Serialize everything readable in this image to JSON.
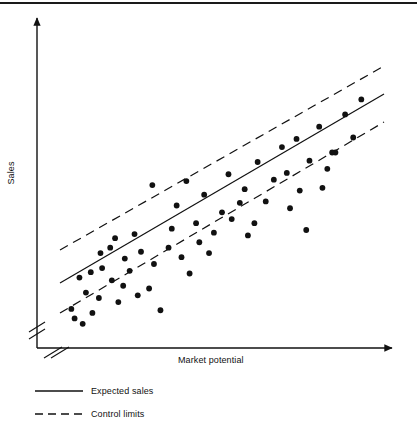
{
  "figure": {
    "kind": "scatter-with-control-limits",
    "background_color": "#ffffff",
    "ink_color": "#111111",
    "top_rule_color": "#1a1a1a"
  },
  "axes": {
    "x_title": "Market potential",
    "y_title": "Sales",
    "x_has_arrow": true,
    "y_has_arrow": true,
    "x_has_break_mark": true,
    "y_has_break_mark": true,
    "x_tick_labels": [],
    "y_tick_labels": [],
    "grid": false
  },
  "legend": {
    "position": "below-plot-left",
    "items": [
      {
        "label": "Expected sales",
        "style": "solid"
      },
      {
        "label": "Control limits",
        "style": "dashed"
      }
    ]
  },
  "chart_data": {
    "type": "scatter",
    "title": "",
    "subtitle": "",
    "xlabel": "Market potential",
    "ylabel": "Sales",
    "xlim": [
      0,
      100
    ],
    "ylim": [
      0,
      100
    ],
    "grid": false,
    "legend_position": "below-plot-left",
    "annotations": [],
    "series": [
      {
        "name": "Observed sales",
        "type": "scatter",
        "marker": "filled-circle",
        "marker_size_px": 4,
        "color": "#111111",
        "points": [
          [
            3.5,
            8.5
          ],
          [
            7.0,
            3.0
          ],
          [
            4.5,
            5.0
          ],
          [
            10.0,
            7.0
          ],
          [
            6.0,
            20.0
          ],
          [
            9.5,
            22.0
          ],
          [
            12.5,
            29.0
          ],
          [
            15.5,
            31.0
          ],
          [
            8.0,
            14.5
          ],
          [
            12.0,
            12.5
          ],
          [
            17.0,
            34.5
          ],
          [
            20.0,
            27.0
          ],
          [
            16.0,
            19.0
          ],
          [
            19.5,
            17.0
          ],
          [
            13.0,
            23.5
          ],
          [
            23.0,
            36.0
          ],
          [
            21.5,
            22.5
          ],
          [
            25.0,
            29.5
          ],
          [
            18.0,
            11.0
          ],
          [
            24.0,
            13.5
          ],
          [
            27.5,
            16.0
          ],
          [
            31.0,
            8.0
          ],
          [
            29.0,
            25.0
          ],
          [
            33.5,
            31.0
          ],
          [
            28.5,
            54.0
          ],
          [
            34.5,
            38.0
          ],
          [
            37.5,
            27.5
          ],
          [
            40.0,
            21.5
          ],
          [
            36.0,
            46.5
          ],
          [
            42.0,
            40.0
          ],
          [
            39.0,
            55.5
          ],
          [
            44.5,
            50.5
          ],
          [
            43.0,
            33.0
          ],
          [
            47.5,
            36.5
          ],
          [
            50.0,
            44.0
          ],
          [
            46.0,
            29.0
          ],
          [
            53.0,
            41.5
          ],
          [
            55.5,
            47.5
          ],
          [
            52.0,
            58.0
          ],
          [
            58.0,
            35.5
          ],
          [
            57.0,
            52.5
          ],
          [
            61.0,
            62.5
          ],
          [
            63.5,
            48.0
          ],
          [
            66.0,
            56.0
          ],
          [
            60.0,
            40.0
          ],
          [
            68.5,
            68.0
          ],
          [
            71.0,
            45.5
          ],
          [
            70.0,
            58.5
          ],
          [
            74.0,
            52.0
          ],
          [
            73.0,
            71.0
          ],
          [
            77.0,
            63.0
          ],
          [
            76.0,
            37.5
          ],
          [
            80.0,
            75.5
          ],
          [
            82.5,
            60.0
          ],
          [
            81.0,
            53.0
          ],
          [
            85.0,
            66.0
          ],
          [
            84.0,
            66.0
          ],
          [
            88.0,
            80.0
          ],
          [
            90.5,
            71.5
          ],
          [
            93.0,
            85.5
          ]
        ]
      },
      {
        "name": "Expected sales",
        "type": "line",
        "style": "solid",
        "color": "#111111",
        "x": [
          0,
          100
        ],
        "y": [
          13,
          92
        ]
      },
      {
        "name": "Upper control limit",
        "type": "line",
        "style": "dashed",
        "color": "#111111",
        "x": [
          0,
          100
        ],
        "y": [
          26,
          101
        ]
      },
      {
        "name": "Lower control limit",
        "type": "line",
        "style": "dashed",
        "color": "#111111",
        "x": [
          0,
          100
        ],
        "y": [
          1,
          79
        ]
      }
    ]
  }
}
